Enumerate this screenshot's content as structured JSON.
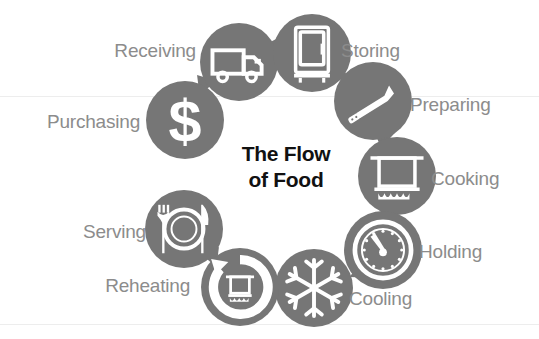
{
  "diagram": {
    "title_line1": "The Flow",
    "title_line2": "of Food",
    "accent_gray": "#767676",
    "label_gray": "#8c8c8c",
    "title_black": "#111111",
    "background": "#ffffff",
    "steps": [
      {
        "id": "purchasing",
        "label": "Purchasing",
        "icon": "dollar-sign-icon",
        "order": 1,
        "cx": 185,
        "cy": 120,
        "r": 39,
        "label_side": "left",
        "label_x": 140,
        "label_y": 121
      },
      {
        "id": "receiving",
        "label": "Receiving",
        "icon": "delivery-truck-icon",
        "order": 2,
        "cx": 239,
        "cy": 62,
        "r": 39,
        "label_side": "left",
        "label_x": 196,
        "label_y": 50
      },
      {
        "id": "storing",
        "label": "Storing",
        "icon": "refrigerator-icon",
        "order": 3,
        "cx": 312,
        "cy": 53,
        "r": 39,
        "label_side": "right",
        "label_x": 341,
        "label_y": 50
      },
      {
        "id": "preparing",
        "label": "Preparing",
        "icon": "chef-knife-icon",
        "order": 4,
        "cx": 373,
        "cy": 101,
        "r": 39,
        "label_side": "right",
        "label_x": 410,
        "label_y": 104
      },
      {
        "id": "cooking",
        "label": "Cooking",
        "icon": "cooking-pot-icon",
        "order": 5,
        "cx": 397,
        "cy": 176,
        "r": 39,
        "label_side": "right",
        "label_x": 431,
        "label_y": 178
      },
      {
        "id": "holding",
        "label": "Holding",
        "icon": "dial-thermometer-icon",
        "order": 6,
        "cx": 383,
        "cy": 250,
        "r": 39,
        "label_side": "right",
        "label_x": 419,
        "label_y": 251
      },
      {
        "id": "cooling",
        "label": "Cooling",
        "icon": "snowflake-icon",
        "order": 7,
        "cx": 314,
        "cy": 288,
        "r": 39,
        "label_side": "right",
        "label_x": 349,
        "label_y": 298
      },
      {
        "id": "reheating",
        "label": "Reheating",
        "icon": "reheat-pot-icon",
        "order": 8,
        "cx": 240,
        "cy": 287,
        "r": 39,
        "label_side": "left",
        "label_x": 190,
        "label_y": 285
      },
      {
        "id": "serving",
        "label": "Serving",
        "icon": "plate-fork-knife-icon",
        "order": 9,
        "cx": 184,
        "cy": 229,
        "r": 39,
        "label_side": "left",
        "label_x": 146,
        "label_y": 231
      }
    ],
    "arrows": [
      {
        "id": "arrow-purchasing-receiving",
        "from": "purchasing",
        "to": "receiving",
        "x": 208,
        "y": 88,
        "rotate": 140
      },
      {
        "id": "arrow-receiving-storing",
        "from": "receiving",
        "to": "storing",
        "x": 277,
        "y": 49,
        "rotate": 95
      },
      {
        "id": "arrow-storing-preparing",
        "from": "storing",
        "to": "preparing",
        "x": 343,
        "y": 70,
        "rotate": 50
      },
      {
        "id": "arrow-preparing-cooking",
        "from": "preparing",
        "to": "cooking",
        "x": 384,
        "y": 131,
        "rotate": 10
      },
      {
        "id": "arrow-cooking-holding",
        "from": "cooking",
        "to": "holding",
        "x": 390,
        "y": 208,
        "rotate": -10
      },
      {
        "id": "arrow-holding-cooling",
        "from": "holding",
        "to": "cooling",
        "x": 356,
        "y": 268,
        "rotate": -55
      },
      {
        "id": "arrow-cooling-reheating",
        "from": "cooling",
        "to": "reheating",
        "x": 281,
        "y": 287,
        "rotate": -95
      },
      {
        "id": "arrow-reheating-serving",
        "from": "reheating",
        "to": "serving",
        "x": 208,
        "y": 260,
        "rotate": -140
      }
    ]
  }
}
